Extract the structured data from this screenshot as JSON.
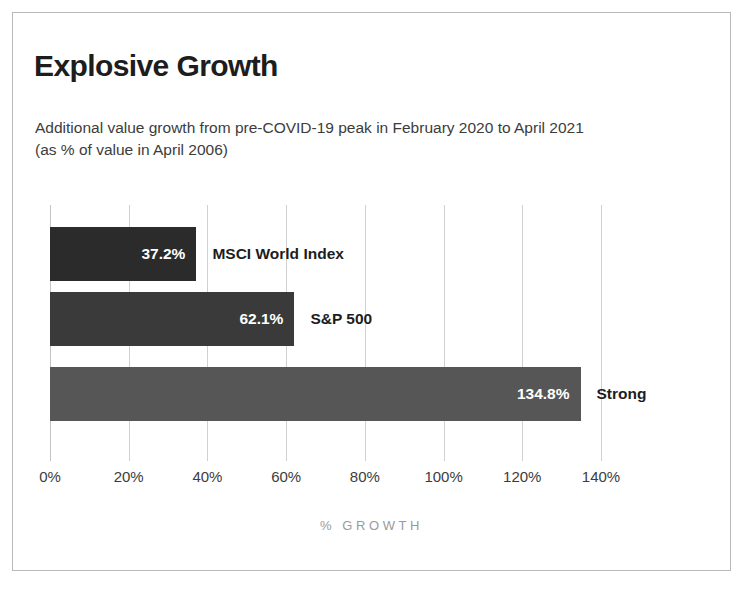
{
  "chart_data": {
    "type": "bar",
    "orientation": "horizontal",
    "title": "Explosive Growth",
    "subtitle": "Additional value growth from pre-COVID-19 peak in February 2020 to April 2021 (as % of value in April 2006)",
    "categories": [
      "MSCI World Index",
      "S&P 500",
      "Strong"
    ],
    "values": [
      37.2,
      62.1,
      134.8
    ],
    "value_labels": [
      "37.2%",
      "62.1%",
      "134.8%"
    ],
    "bar_colors": [
      "#2b2b2b",
      "#3a3a3a",
      "#565656"
    ],
    "xlabel": "% GROWTH",
    "ylabel": "",
    "xlim": [
      0,
      140
    ],
    "xticks": [
      0,
      20,
      40,
      60,
      80,
      100,
      120,
      140
    ],
    "xtick_labels": [
      "0%",
      "20%",
      "40%",
      "60%",
      "80%",
      "100%",
      "120%",
      "140%"
    ],
    "grid": true,
    "grid_axis": "x",
    "grid_color": "#d0d0d0",
    "legend": false,
    "frame_color": "#b9b9b9",
    "background": "#ffffff"
  }
}
